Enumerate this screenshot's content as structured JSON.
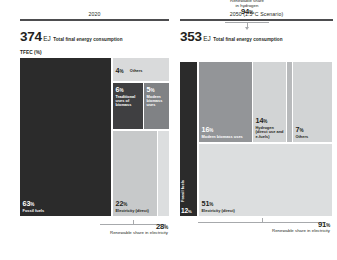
{
  "chart_data": {
    "type": "bar",
    "ylabel": "TFEC (%)",
    "axis_label": "TFEC (%)",
    "panels": [
      {
        "key": "p2020",
        "title": "2020",
        "total_value": "374",
        "total_unit": "EJ",
        "total_desc": "Total final energy consumption",
        "categories": [
          {
            "id": "fossil-fuels",
            "pct": "63",
            "pct_sign": "%",
            "name": "Fossil fuels",
            "color": "#2b2b2b",
            "tone": "dark"
          },
          {
            "id": "others",
            "pct": "4",
            "pct_sign": "%",
            "name": "Others",
            "color": "#d9dadb",
            "tone": "light"
          },
          {
            "id": "traditional-biomass",
            "pct": "6",
            "pct_sign": "%",
            "name": "Traditional uses of biomass",
            "color": "#3f3f41",
            "tone": "dark"
          },
          {
            "id": "modern-biomass",
            "pct": "5",
            "pct_sign": "%",
            "name": "Modern biomass uses",
            "color": "#808285",
            "tone": "dark"
          },
          {
            "id": "electricity-direct",
            "pct": "22",
            "pct_sign": "%",
            "name": "Electricity (direct)",
            "color": "#c7c9ca",
            "tone": "light"
          }
        ],
        "callout": {
          "value": "28",
          "pct_sign": "%",
          "label": "Renewable share in electricity"
        }
      },
      {
        "key": "p2050",
        "title": "2050 (1.5°C Scenario)",
        "total_value": "353",
        "total_unit": "EJ",
        "total_desc": "Total final energy consumption",
        "categories": [
          {
            "id": "fossil-fuels",
            "pct": "12",
            "pct_sign": "%",
            "name": "Fossil fuels",
            "color": "#2b2b2b",
            "tone": "dark"
          },
          {
            "id": "modern-biomass",
            "pct": "16",
            "pct_sign": "%",
            "name": "Modern biomass uses",
            "color": "#939598",
            "tone": "dark"
          },
          {
            "id": "hydrogen",
            "pct": "14",
            "pct_sign": "%",
            "name": "Hydrogen (direct use and e-fuels)",
            "color": "#d2d4d5",
            "tone": "light"
          },
          {
            "id": "others",
            "pct": "7",
            "pct_sign": "%",
            "name": "Others",
            "color": "#d2d4d5",
            "tone": "light"
          },
          {
            "id": "electricity-direct",
            "pct": "51",
            "pct_sign": "%",
            "name": "Electricity (direct)",
            "color": "#dcdedf",
            "tone": "light"
          }
        ],
        "callout": {
          "value": "91",
          "pct_sign": "%",
          "label": "Renewable share in electricity"
        },
        "top_callout": {
          "line1": "Renewable share",
          "line2": "in hydrogen",
          "value": "94",
          "pct_sign": "%"
        }
      }
    ]
  }
}
